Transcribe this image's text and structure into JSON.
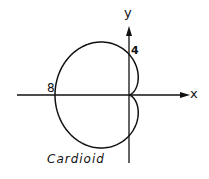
{
  "diagram": {
    "caption": "Cardioid",
    "x_axis_label": "x",
    "y_axis_label": "y",
    "annotations": [
      {
        "text": "8",
        "position": "left intercept on x-axis"
      },
      {
        "text": "4",
        "position": "upper intercept on y-axis"
      }
    ],
    "curve": {
      "type": "cardioid",
      "equation": "r = 4(1 - cos θ)",
      "x_intercept": -8,
      "y_intercepts": [
        4,
        -4
      ]
    },
    "colors": {
      "stroke": "#111111",
      "background": "#ffffff"
    }
  }
}
